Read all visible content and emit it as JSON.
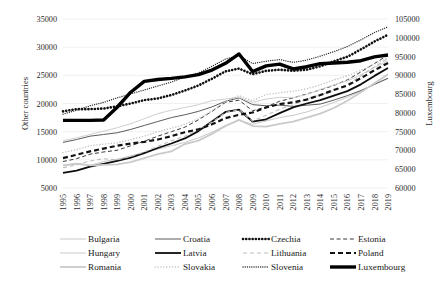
{
  "chart_data": {
    "type": "line",
    "title": "",
    "xlabel": "",
    "ylabel": "Other countries",
    "y2label": "Luxembourg",
    "grid": true,
    "legend_position": "bottom",
    "x": [
      1995,
      1996,
      1997,
      1998,
      1999,
      2000,
      2001,
      2002,
      2003,
      2004,
      2005,
      2006,
      2007,
      2008,
      2009,
      2010,
      2011,
      2012,
      2013,
      2014,
      2015,
      2016,
      2017,
      2018,
      2019
    ],
    "xticks": [
      "1995",
      "1996",
      "1997",
      "1998",
      "1999",
      "2000",
      "2001",
      "2002",
      "2003",
      "2004",
      "2005",
      "2006",
      "2007",
      "2008",
      "2009",
      "2010",
      "2011",
      "2012",
      "2013",
      "2014",
      "2015",
      "2016",
      "2017",
      "2018",
      "2019"
    ],
    "yticks": [
      "5000",
      "10000",
      "15000",
      "20000",
      "25000",
      "30000",
      "35000"
    ],
    "ylim": [
      5000,
      35000
    ],
    "y2ticks": [
      "60000",
      "65000",
      "70000",
      "75000",
      "80000",
      "85000",
      "90000",
      "95000",
      "100000",
      "105000"
    ],
    "y2lim": [
      60000,
      105000
    ],
    "series": [
      {
        "name": "Bulgaria",
        "axis": "left",
        "style": "solid-thin-light",
        "color": "#c9c9c9",
        "values": [
          9000,
          9400,
          9000,
          9700,
          10100,
          10700,
          11300,
          11900,
          12500,
          13100,
          13900,
          14900,
          16100,
          17000,
          16300,
          16900,
          17500,
          17900,
          18500,
          19300,
          20200,
          21100,
          22200,
          23400,
          24400
        ]
      },
      {
        "name": "Croatia",
        "axis": "left",
        "style": "solid-thin-dark",
        "color": "#4a4a4a",
        "values": [
          13100,
          13600,
          14200,
          14500,
          14800,
          15400,
          16100,
          16800,
          17500,
          18000,
          18600,
          19400,
          20400,
          21000,
          19800,
          19600,
          19700,
          19500,
          19700,
          19900,
          20600,
          21400,
          22300,
          23400,
          24500
        ]
      },
      {
        "name": "Czechia",
        "axis": "left",
        "style": "dotted-thick",
        "color": "#111111",
        "values": [
          18600,
          19000,
          19000,
          19100,
          19500,
          20000,
          20600,
          20900,
          21500,
          22300,
          23200,
          24400,
          25700,
          26200,
          25200,
          25800,
          26000,
          25800,
          26000,
          26600,
          27500,
          28300,
          29600,
          31000,
          32200
        ]
      },
      {
        "name": "Estonia",
        "axis": "left",
        "style": "dashed-thin",
        "color": "#3a3a3a",
        "values": [
          9700,
          10200,
          11000,
          11400,
          11700,
          12500,
          13300,
          14200,
          15000,
          15800,
          17100,
          18600,
          20200,
          20600,
          18700,
          19400,
          20400,
          21000,
          21700,
          22400,
          23200,
          24200,
          25600,
          27100,
          28600
        ]
      },
      {
        "name": "Hungary",
        "axis": "left",
        "style": "solid-thin-light",
        "color": "#cfcfcf",
        "values": [
          13400,
          13900,
          14500,
          15100,
          15700,
          16400,
          17300,
          18200,
          18800,
          19300,
          19800,
          20500,
          20800,
          21100,
          20200,
          20800,
          21100,
          21000,
          21600,
          22500,
          23300,
          24000,
          25100,
          26400,
          27600
        ]
      },
      {
        "name": "Latvia",
        "axis": "left",
        "style": "solid-thick",
        "color": "#0d0d0d",
        "values": [
          7700,
          8100,
          8800,
          9300,
          9800,
          10400,
          11200,
          12100,
          12900,
          13800,
          15100,
          16800,
          18500,
          18900,
          16800,
          17200,
          18300,
          19300,
          20000,
          20600,
          21400,
          22200,
          23400,
          24900,
          26300
        ]
      },
      {
        "name": "Lithuania",
        "axis": "left",
        "style": "dashed-light",
        "color": "#bdbdbd",
        "values": [
          8600,
          9100,
          9800,
          10200,
          10000,
          10600,
          11400,
          12400,
          13400,
          14200,
          15300,
          16700,
          18400,
          18900,
          16900,
          17900,
          19000,
          19800,
          20800,
          21500,
          22300,
          23400,
          24900,
          26500,
          28000
        ]
      },
      {
        "name": "Poland",
        "axis": "left",
        "style": "dashed-thick",
        "color": "#121212",
        "values": [
          10300,
          10900,
          11500,
          12000,
          12500,
          12900,
          13200,
          13600,
          14200,
          14900,
          15400,
          16300,
          17400,
          18000,
          18400,
          19300,
          19900,
          20200,
          20700,
          21500,
          22400,
          23200,
          24500,
          25900,
          27200
        ]
      },
      {
        "name": "Romania",
        "axis": "left",
        "style": "solid-thick-light",
        "color": "#cacaca",
        "values": [
          9000,
          9300,
          9000,
          9100,
          9200,
          9600,
          10300,
          11000,
          11500,
          12800,
          13400,
          14600,
          16000,
          17100,
          16000,
          15900,
          16400,
          16800,
          17500,
          18200,
          19200,
          20500,
          22000,
          23600,
          25200
        ]
      },
      {
        "name": "Slovakia",
        "axis": "left",
        "style": "dotted-light",
        "color": "#c0c0c0",
        "values": [
          11300,
          11800,
          12500,
          12800,
          13000,
          13600,
          14200,
          15000,
          15600,
          16300,
          17300,
          18700,
          20400,
          21400,
          20500,
          21600,
          21900,
          22200,
          22600,
          23300,
          24200,
          24900,
          25900,
          27000,
          28100
        ]
      },
      {
        "name": "Slovenia",
        "axis": "left",
        "style": "dotted-thin",
        "color": "#2a2a2a",
        "values": [
          18100,
          18800,
          19600,
          20200,
          21000,
          21700,
          22400,
          23100,
          23800,
          24700,
          25400,
          26600,
          27900,
          28500,
          27100,
          27500,
          27800,
          27300,
          27700,
          28400,
          29200,
          30100,
          31300,
          32600,
          33600
        ]
      },
      {
        "name": "Luxembourg",
        "axis": "right",
        "style": "solid-extrathick",
        "color": "#000000",
        "values": [
          78000,
          78000,
          78000,
          78100,
          81500,
          85500,
          88400,
          88900,
          89200,
          89600,
          90200,
          91400,
          93200,
          95700,
          91000,
          92500,
          93000,
          91700,
          92300,
          93100,
          93300,
          93500,
          93900,
          94900,
          95400
        ]
      }
    ]
  },
  "axes": {
    "left_title": "Other countries",
    "right_title": "Luxembourg"
  },
  "legend": {
    "rows": [
      [
        {
          "label": "Bulgaria",
          "style": "solid-thin-light"
        },
        {
          "label": "Croatia",
          "style": "solid-thin-dark"
        },
        {
          "label": "Czechia",
          "style": "dotted-thick"
        },
        {
          "label": "Estonia",
          "style": "dashed-thin"
        }
      ],
      [
        {
          "label": "Hungary",
          "style": "solid-thin-light"
        },
        {
          "label": "Latvia",
          "style": "solid-thick"
        },
        {
          "label": "Lithuania",
          "style": "dashed-light"
        },
        {
          "label": "Poland",
          "style": "dashed-thick"
        }
      ],
      [
        {
          "label": "Romania",
          "style": "solid-thick-light"
        },
        {
          "label": "Slovakia",
          "style": "dotted-light"
        },
        {
          "label": "Slovenia",
          "style": "dotted-thin"
        },
        {
          "label": "Luxembourg",
          "style": "solid-extrathick"
        }
      ]
    ]
  }
}
